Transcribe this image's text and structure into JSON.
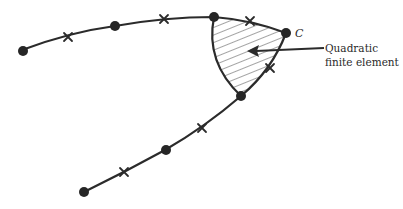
{
  "figure": {
    "type": "finite element mesh boundary diagram",
    "corner_label": "C",
    "annotation": {
      "line1": "Quadratic",
      "line2": "finite element"
    },
    "legend_semantics": {
      "filled_circle": "corner node",
      "cross": "midside node",
      "hatched_region": "quadratic finite element"
    },
    "colors": {
      "ink": "#2b2b2b",
      "background": "#ffffff"
    }
  }
}
